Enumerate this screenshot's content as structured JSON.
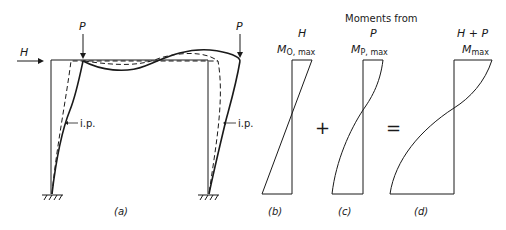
{
  "figure": {
    "panel_a": {
      "caption": "(a)",
      "loads": {
        "horizontal_label": "H",
        "vertical_left_label": "P",
        "vertical_right_label": "P"
      },
      "inflection_label_left": "i.p.",
      "inflection_label_right": "i.p."
    },
    "header": {
      "title": "Moments from"
    },
    "panel_b": {
      "caption": "(b)",
      "load_label": "H",
      "moment_symbol": "M",
      "moment_subscript": "O, max"
    },
    "operator_plus": "+",
    "panel_c": {
      "caption": "(c)",
      "load_label": "P",
      "moment_symbol": "M",
      "moment_subscript": "P, max"
    },
    "operator_equals": "=",
    "panel_d": {
      "caption": "(d)",
      "load_label": "H + P",
      "moment_symbol": "M",
      "moment_subscript": "max"
    }
  },
  "colors": {
    "ink": "#1a1a1a",
    "background": "#ffffff"
  }
}
